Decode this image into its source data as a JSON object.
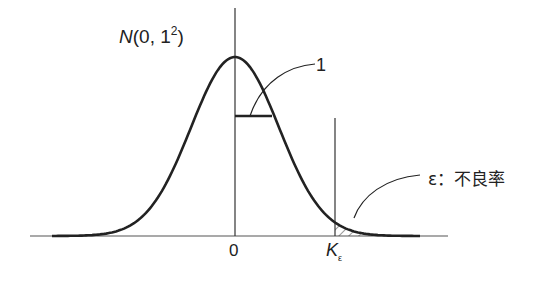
{
  "diagram": {
    "title": {
      "symbol": "N",
      "args": "(0, 1",
      "exp": "2",
      "close": ")"
    },
    "width_label": "1",
    "zero_label": "0",
    "k_label": {
      "base": "K",
      "sub": "ε"
    },
    "tail_label": "ε：不良率"
  },
  "colors": {
    "line": "#222222",
    "axis": "#444444"
  }
}
